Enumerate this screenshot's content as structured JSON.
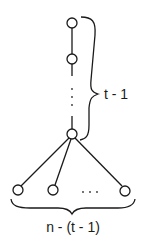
{
  "diagram": {
    "type": "graph",
    "labels": {
      "path_count": "t - 1",
      "leaf_count": "n - (t - 1)",
      "path_ellipsis": "⋮",
      "leaf_ellipsis": ". . ."
    },
    "nodes": [
      {
        "id": "p1",
        "role": "path-top"
      },
      {
        "id": "p2",
        "role": "path"
      },
      {
        "id": "hub",
        "role": "hub"
      },
      {
        "id": "l1",
        "role": "leaf"
      },
      {
        "id": "l2",
        "role": "leaf"
      },
      {
        "id": "l3",
        "role": "leaf-last"
      }
    ],
    "edges": [
      [
        "p1",
        "p2"
      ],
      [
        "p2",
        "hub"
      ],
      [
        "hub",
        "l1"
      ],
      [
        "hub",
        "l2"
      ],
      [
        "hub",
        "l3"
      ]
    ],
    "colors": {
      "stroke": "#1a1a1a",
      "background": "#ffffff"
    }
  }
}
